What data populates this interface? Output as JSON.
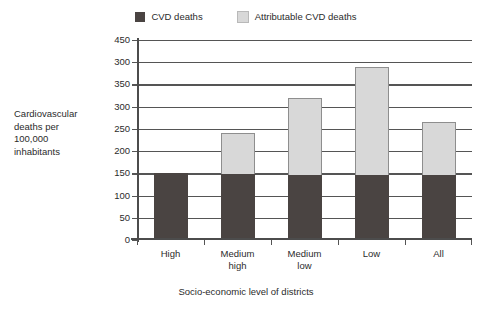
{
  "chart_data": {
    "type": "bar",
    "subtype": "stacked-vertical",
    "title": "",
    "categories": [
      "High",
      "Medium high",
      "Medium low",
      "Low",
      "All"
    ],
    "category_lines": [
      [
        "High"
      ],
      [
        "Medium",
        "high"
      ],
      [
        "Medium",
        "low"
      ],
      [
        "Low"
      ],
      [
        "All"
      ]
    ],
    "series": [
      {
        "name": "CVD deaths",
        "color": "#4a4442",
        "values": [
          150,
          148,
          147,
          147,
          146
        ]
      },
      {
        "name": "Attributable CVD deaths",
        "color": "#d8d8d8",
        "values": [
          0,
          92,
          173,
          243,
          119
        ]
      }
    ],
    "totals": [
      150,
      240,
      320,
      390,
      265
    ],
    "xlabel": "Socio-economic level of districts",
    "ylabel": "Cardiovascular deaths per 100,000 inhabitants",
    "ylabel_lines": [
      "Cardiovascular",
      "deaths per",
      "100,000",
      "inhabitants"
    ],
    "ylim": [
      0,
      450
    ],
    "ytick_values": [
      0,
      50,
      100,
      150,
      200,
      250,
      300,
      350,
      400,
      450
    ],
    "ytick_labels": [
      "0",
      "50",
      "100",
      "150",
      "200",
      "250",
      "300",
      "350",
      "300",
      "450"
    ],
    "grid": true,
    "legend_position": "top-center",
    "legend": [
      {
        "label": "CVD deaths",
        "color": "#4a4442"
      },
      {
        "label": "Attributable CVD deaths",
        "color": "#d8d8d8"
      }
    ]
  },
  "colors": {
    "series_dark": "#4a4442",
    "series_light": "#d8d8d8",
    "axis": "#4c4c4c",
    "grid": "#555555",
    "text": "#2b2b2b",
    "background": "#ffffff"
  }
}
